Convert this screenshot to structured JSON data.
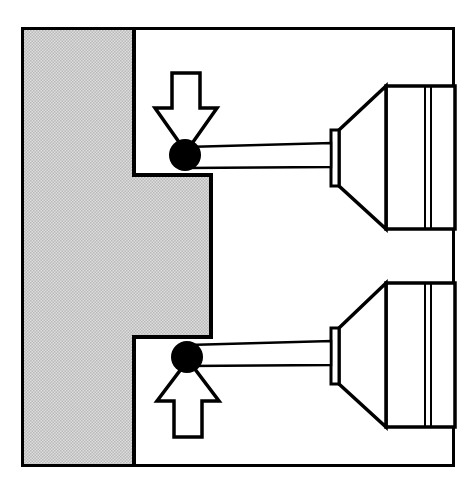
{
  "figure": {
    "title": "Touch-trigger probe measurement of a stepped workpiece",
    "domain_label": "Technical line drawing",
    "view_type": "cross-section",
    "background_color": "#ffffff",
    "frame": {
      "name": "drawing-border",
      "x": 21,
      "y": 27,
      "width": 434,
      "height": 440,
      "stroke_color": "#000000",
      "stroke_width": 3,
      "fill": "none"
    },
    "workpiece": {
      "label": "Workpiece (sectioned)",
      "hatch_fill_color": "#d4d4d4",
      "hatch_line_color": "#9a9a9a",
      "outline_color": "#000000",
      "outline_width": 4,
      "shape_points": "24,30 134,30 134,175 211,175 211,337 134,337 134,464 24,464",
      "features": [
        {
          "name": "upper-shoulder-face",
          "label": "Upper shoulder (probed from above)",
          "y": 175,
          "x_start": 134,
          "x_end": 211
        },
        {
          "name": "tongue-flank-face",
          "label": "Tongue flank",
          "x": 211,
          "y_start": 175,
          "y_end": 337
        },
        {
          "name": "lower-shoulder-face",
          "label": "Lower shoulder (probed from below)",
          "y": 337,
          "x_start": 134,
          "x_end": 211
        }
      ]
    },
    "probes": [
      {
        "name": "upper-probe",
        "label": "Upper touch-trigger probe",
        "orientation": "probing downward",
        "axis_y": 155,
        "ball": {
          "name": "upper-stylus-ball",
          "label": "Stylus ball",
          "cx": 185,
          "cy": 155,
          "r": 16,
          "fill_color": "#000000"
        },
        "stylus": {
          "name": "upper-stylus-shaft",
          "label": "Stylus shaft",
          "x_start": 186,
          "x_end": 331,
          "y_top_start": 147,
          "y_top_end": 143,
          "y_bottom_start": 168,
          "y_bottom_end": 167,
          "fill_color": "#ffffff",
          "stroke_color": "#000000"
        },
        "nose": {
          "name": "upper-probe-nose-plate",
          "label": "Probe nose plate",
          "x": 331,
          "y": 130,
          "width": 8,
          "height": 56
        },
        "cone": {
          "name": "upper-probe-cone",
          "label": "Conical probe body",
          "points": "339,130 386,86 386,229 339,186",
          "fill_color": "#ffffff"
        },
        "barrel": {
          "name": "upper-probe-barrel",
          "label": "Probe barrel",
          "x": 386,
          "y": 86,
          "width": 69,
          "height": 143,
          "fill_color": "#ffffff"
        },
        "barrel_lines_x": [
          425,
          431
        ],
        "force_arrow": {
          "name": "upper-force-arrow",
          "label": "Probing force direction (downward)",
          "direction": "down",
          "points": "172,73 200,73 200,108 217,108 186,152 155,108 172,108",
          "fill_color": "#ffffff",
          "stroke_color": "#000000"
        }
      },
      {
        "name": "lower-probe",
        "label": "Lower touch-trigger probe",
        "orientation": "probing upward",
        "axis_y": 357,
        "ball": {
          "name": "lower-stylus-ball",
          "label": "Stylus ball",
          "cx": 187,
          "cy": 357,
          "r": 16,
          "fill_color": "#000000"
        },
        "stylus": {
          "name": "lower-stylus-shaft",
          "label": "Stylus shaft",
          "x_start": 188,
          "x_end": 331,
          "y_top_start": 345,
          "y_top_end": 341,
          "y_bottom_start": 366,
          "y_bottom_end": 365,
          "fill_color": "#ffffff",
          "stroke_color": "#000000"
        },
        "nose": {
          "name": "lower-probe-nose-plate",
          "label": "Probe nose plate",
          "x": 331,
          "y": 328,
          "width": 8,
          "height": 56
        },
        "cone": {
          "name": "lower-probe-cone",
          "label": "Conical probe body",
          "points": "339,328 386,283 386,427 339,384",
          "fill_color": "#ffffff"
        },
        "barrel": {
          "name": "lower-probe-barrel",
          "label": "Probe barrel",
          "x": 386,
          "y": 283,
          "width": 69,
          "height": 144,
          "fill_color": "#ffffff"
        },
        "barrel_lines_x": [
          425,
          431
        ],
        "force_arrow": {
          "name": "lower-force-arrow",
          "label": "Probing force direction (upward)",
          "direction": "up",
          "points": "174,437 202,437 202,401 219,401 188,360 157,401 174,401",
          "fill_color": "#ffffff",
          "stroke_color": "#000000"
        }
      }
    ],
    "colors": {
      "ink": "#000000",
      "paper": "#ffffff",
      "hatch": "#d4d4d4",
      "hatch_line": "#9a9a9a"
    }
  }
}
